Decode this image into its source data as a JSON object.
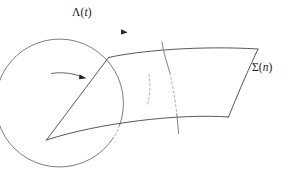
{
  "figure": {
    "background_color": "#ffffff",
    "stroke_color": "#4a4a4a",
    "stroke_color_dark": "#2d2d2d",
    "labels": {
      "lambda": {
        "text": "Λ(t)",
        "symbol": "Λ",
        "argument_open": "(",
        "argument": "t",
        "argument_close": ")"
      },
      "sigma": {
        "text": "Σ(n)",
        "symbol": "Σ",
        "argument_open": "(",
        "argument": "n",
        "argument_close": ")"
      }
    },
    "elements": [
      {
        "name": "orbit-circle",
        "kind": "circle",
        "cx": 86,
        "cy": 95,
        "r": 64,
        "dashed_portion": "right-lower arc behind surface"
      },
      {
        "name": "surface-patch",
        "kind": "quadrilateral-surface",
        "corners": [
          [
            108,
            57
          ],
          [
            258,
            49
          ],
          [
            228,
            117
          ],
          [
            46,
            140
          ]
        ]
      },
      {
        "name": "trajectory-line",
        "kind": "line",
        "from": [
          46,
          140
        ],
        "to": [
          108,
          57
        ]
      },
      {
        "name": "crossing-curve",
        "kind": "curve",
        "from": [
          163,
          43
        ],
        "to": [
          177,
          133
        ],
        "hidden_segment": true
      },
      {
        "name": "orbit-arrow",
        "kind": "arrowhead",
        "at": [
          125,
          32
        ],
        "direction": "clockwise"
      },
      {
        "name": "inflow-arrow",
        "kind": "arrowhead",
        "at": [
          84,
          77
        ],
        "direction": "right"
      }
    ]
  }
}
